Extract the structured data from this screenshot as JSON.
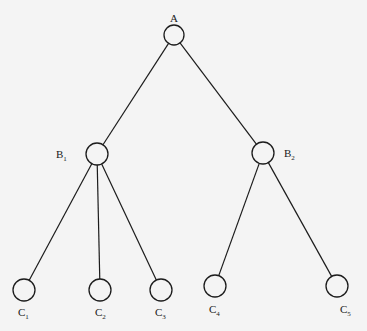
{
  "diagram": {
    "type": "tree",
    "background": "#f4f4f4",
    "stroke_color": "#1c1c1c",
    "nodes": [
      {
        "id": "A",
        "label": "A",
        "sub": "",
        "cx": 174,
        "cy": 35,
        "r": 10,
        "lx": 170,
        "ly": 22
      },
      {
        "id": "B1",
        "label": "B",
        "sub": "1",
        "cx": 97,
        "cy": 154,
        "r": 11,
        "lx": 56,
        "ly": 158
      },
      {
        "id": "B2",
        "label": "B",
        "sub": "2",
        "cx": 263,
        "cy": 153,
        "r": 11,
        "lx": 284,
        "ly": 157
      },
      {
        "id": "C1",
        "label": "C",
        "sub": "1",
        "cx": 24,
        "cy": 290,
        "r": 11,
        "lx": 18,
        "ly": 316
      },
      {
        "id": "C2",
        "label": "C",
        "sub": "2",
        "cx": 100,
        "cy": 290,
        "r": 11,
        "lx": 95,
        "ly": 316
      },
      {
        "id": "C3",
        "label": "C",
        "sub": "3",
        "cx": 161,
        "cy": 290,
        "r": 11,
        "lx": 155,
        "ly": 316
      },
      {
        "id": "C4",
        "label": "C",
        "sub": "4",
        "cx": 215,
        "cy": 286,
        "r": 11,
        "lx": 209,
        "ly": 313
      },
      {
        "id": "C5",
        "label": "C",
        "sub": "5",
        "cx": 337,
        "cy": 286,
        "r": 11,
        "lx": 340,
        "ly": 313
      }
    ],
    "edges": [
      {
        "from": "A",
        "to": "B1"
      },
      {
        "from": "A",
        "to": "B2"
      },
      {
        "from": "B1",
        "to": "C1"
      },
      {
        "from": "B1",
        "to": "C2"
      },
      {
        "from": "B1",
        "to": "C3"
      },
      {
        "from": "B2",
        "to": "C4"
      },
      {
        "from": "B2",
        "to": "C5"
      }
    ]
  }
}
